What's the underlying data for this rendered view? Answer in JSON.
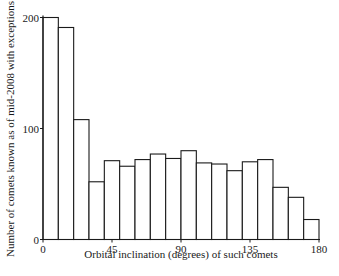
{
  "chart_data": {
    "type": "bar",
    "title": "",
    "xlabel": "Orbital inclination (degrees) of such comets",
    "ylabel": "Number of comets known as of mid-2008 with exceptions",
    "bin_width": 10,
    "bin_edges": [
      0,
      10,
      20,
      30,
      40,
      50,
      60,
      70,
      80,
      90,
      100,
      110,
      120,
      130,
      140,
      150,
      160,
      170,
      180
    ],
    "categories": [
      "0-10",
      "10-20",
      "20-30",
      "30-40",
      "40-50",
      "50-60",
      "60-70",
      "70-80",
      "80-90",
      "90-100",
      "100-110",
      "110-120",
      "120-130",
      "130-140",
      "140-150",
      "150-160",
      "160-170",
      "170-180"
    ],
    "values": [
      200,
      191,
      108,
      52,
      71,
      66,
      72,
      77,
      73,
      80,
      69,
      68,
      62,
      70,
      72,
      47,
      38,
      18
    ],
    "xlim": [
      0,
      180
    ],
    "ylim": [
      0,
      200
    ],
    "xticks": [
      0,
      45,
      90,
      135,
      180
    ],
    "yticks": [
      0,
      100,
      200
    ],
    "grid": false,
    "legend": null
  }
}
